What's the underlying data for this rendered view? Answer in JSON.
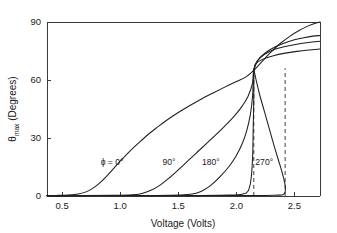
{
  "chart_data": {
    "type": "line",
    "title": "",
    "xlabel": "Voltage (Volts)",
    "ylabel": "θmax (Degrees)",
    "ylabel_base": "θ",
    "ylabel_sub": "max",
    "ylabel_rest": " (Degrees)",
    "xlim": [
      0.37,
      2.72
    ],
    "ylim": [
      0,
      90
    ],
    "xticks": [
      0.5,
      1.0,
      1.5,
      2.0,
      2.5
    ],
    "xtick_labels": [
      "0.5",
      "1.0",
      "1.5",
      "2.0",
      "2.5"
    ],
    "yticks": [
      0,
      30,
      60,
      90
    ],
    "ytick_labels": [
      "0",
      "30",
      "60",
      "90"
    ],
    "grid": false,
    "legend": "inline-curve-labels",
    "crossing_point": {
      "x": 2.15,
      "y": 65
    },
    "annotations": [
      {
        "name": "phi-0-label",
        "text": "ϕ = 0°",
        "x": 0.93,
        "y": 16
      },
      {
        "name": "phi-90-label",
        "text": "90°",
        "x": 1.42,
        "y": 16
      },
      {
        "name": "phi-180-label",
        "text": "180°",
        "x": 1.78,
        "y": 16
      },
      {
        "name": "phi-270-label",
        "text": "270°",
        "x": 2.24,
        "y": 16
      }
    ],
    "dashed_verticals": [
      {
        "name": "threshold-line-lower",
        "x": 2.15,
        "y_from": 0,
        "y_to": 66
      },
      {
        "name": "threshold-line-upper",
        "x": 2.42,
        "y_from": 0,
        "y_to": 66
      }
    ],
    "series": [
      {
        "name": "ϕ = 0°",
        "threshold_voltage": 0.65,
        "end_value": 90,
        "points": [
          [
            0.37,
            0.2
          ],
          [
            0.45,
            0.3
          ],
          [
            0.52,
            0.4
          ],
          [
            0.58,
            0.6
          ],
          [
            0.64,
            1.0
          ],
          [
            0.7,
            2.0
          ],
          [
            0.76,
            3.8
          ],
          [
            0.82,
            6.5
          ],
          [
            0.88,
            10.0
          ],
          [
            0.94,
            14.0
          ],
          [
            1.0,
            18.0
          ],
          [
            1.08,
            23.0
          ],
          [
            1.16,
            27.5
          ],
          [
            1.24,
            31.8
          ],
          [
            1.32,
            35.6
          ],
          [
            1.4,
            39.2
          ],
          [
            1.5,
            43.2
          ],
          [
            1.6,
            46.8
          ],
          [
            1.7,
            50.2
          ],
          [
            1.8,
            53.3
          ],
          [
            1.9,
            56.3
          ],
          [
            2.0,
            59.2
          ],
          [
            2.08,
            61.5
          ],
          [
            2.15,
            65.0
          ],
          [
            2.22,
            69.5
          ],
          [
            2.3,
            74.5
          ],
          [
            2.38,
            79.0
          ],
          [
            2.46,
            82.6
          ],
          [
            2.54,
            85.6
          ],
          [
            2.62,
            88.0
          ],
          [
            2.68,
            89.4
          ],
          [
            2.72,
            90.0
          ]
        ]
      },
      {
        "name": "90°",
        "threshold_voltage": 1.2,
        "end_value": 83,
        "points": [
          [
            0.37,
            0.2
          ],
          [
            0.7,
            0.25
          ],
          [
            0.95,
            0.35
          ],
          [
            1.1,
            0.6
          ],
          [
            1.18,
            1.2
          ],
          [
            1.26,
            2.8
          ],
          [
            1.34,
            5.5
          ],
          [
            1.42,
            9.2
          ],
          [
            1.5,
            13.5
          ],
          [
            1.58,
            18.0
          ],
          [
            1.66,
            22.5
          ],
          [
            1.74,
            27.0
          ],
          [
            1.82,
            31.5
          ],
          [
            1.9,
            36.2
          ],
          [
            1.98,
            41.2
          ],
          [
            2.05,
            46.5
          ],
          [
            2.1,
            51.5
          ],
          [
            2.14,
            58.5
          ],
          [
            2.15,
            65.0
          ],
          [
            2.19,
            70.5
          ],
          [
            2.26,
            74.5
          ],
          [
            2.34,
            77.3
          ],
          [
            2.42,
            79.3
          ],
          [
            2.5,
            80.8
          ],
          [
            2.58,
            81.9
          ],
          [
            2.66,
            82.7
          ],
          [
            2.72,
            83.0
          ]
        ]
      },
      {
        "name": "180°",
        "threshold_voltage": 1.65,
        "end_value": 80,
        "points": [
          [
            0.37,
            0.2
          ],
          [
            0.9,
            0.25
          ],
          [
            1.3,
            0.3
          ],
          [
            1.52,
            0.5
          ],
          [
            1.62,
            1.0
          ],
          [
            1.7,
            2.5
          ],
          [
            1.78,
            5.5
          ],
          [
            1.86,
            10.0
          ],
          [
            1.94,
            15.5
          ],
          [
            2.0,
            21.0
          ],
          [
            2.05,
            27.0
          ],
          [
            2.09,
            34.0
          ],
          [
            2.12,
            42.0
          ],
          [
            2.14,
            52.0
          ],
          [
            2.15,
            65.0
          ],
          [
            2.18,
            70.0
          ],
          [
            2.24,
            73.2
          ],
          [
            2.32,
            75.6
          ],
          [
            2.42,
            77.3
          ],
          [
            2.52,
            78.5
          ],
          [
            2.62,
            79.4
          ],
          [
            2.72,
            80.0
          ]
        ]
      },
      {
        "name": "270°",
        "threshold_voltage": 2.1,
        "end_value": 76,
        "hysteresis": true,
        "points": [
          [
            0.37,
            0.2
          ],
          [
            1.2,
            0.25
          ],
          [
            1.7,
            0.3
          ],
          [
            1.95,
            0.45
          ],
          [
            2.05,
            0.9
          ],
          [
            2.1,
            2.5
          ],
          [
            2.125,
            8.0
          ],
          [
            2.14,
            20.0
          ],
          [
            2.145,
            35.0
          ],
          [
            2.15,
            50.0
          ],
          [
            2.152,
            65.0
          ],
          [
            2.17,
            68.5
          ],
          [
            2.23,
            70.8
          ],
          [
            2.32,
            72.6
          ],
          [
            2.42,
            73.9
          ],
          [
            2.52,
            74.8
          ],
          [
            2.62,
            75.5
          ],
          [
            2.72,
            76.0
          ]
        ],
        "return_branch": [
          [
            2.152,
            65.0
          ],
          [
            2.17,
            60.0
          ],
          [
            2.2,
            52.5
          ],
          [
            2.24,
            44.0
          ],
          [
            2.28,
            35.5
          ],
          [
            2.32,
            27.0
          ],
          [
            2.36,
            19.0
          ],
          [
            2.39,
            13.0
          ],
          [
            2.41,
            8.5
          ],
          [
            2.42,
            5.5
          ],
          [
            2.422,
            3.0
          ],
          [
            2.415,
            1.4
          ],
          [
            2.4,
            0.7
          ],
          [
            2.37,
            0.45
          ],
          [
            2.32,
            0.35
          ],
          [
            2.24,
            0.3
          ],
          [
            2.15,
            0.28
          ],
          [
            2.0,
            0.25
          ],
          [
            1.8,
            0.22
          ],
          [
            1.5,
            0.2
          ],
          [
            1.0,
            0.2
          ],
          [
            0.37,
            0.2
          ]
        ]
      }
    ]
  }
}
